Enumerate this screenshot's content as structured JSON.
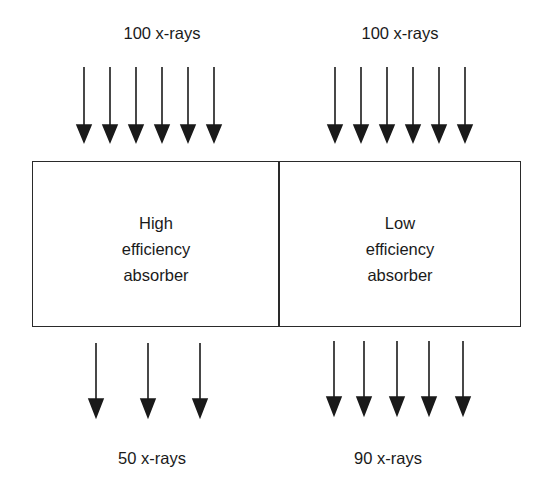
{
  "diagram": {
    "type": "absorber-efficiency-comparison",
    "colors": {
      "line": "#1a1a1a",
      "background": "#ffffff"
    },
    "left": {
      "incident_label": "100 x-rays",
      "incident_arrow_count": 6,
      "absorber_label_lines": [
        "High",
        "efficiency",
        "absorber"
      ],
      "transmitted_label": "50 x-rays",
      "transmitted_arrow_count": 3
    },
    "right": {
      "incident_label": "100 x-rays",
      "incident_arrow_count": 6,
      "absorber_label_lines": [
        "Low",
        "efficiency",
        "absorber"
      ],
      "transmitted_label": "90 x-rays",
      "transmitted_arrow_count": 5
    }
  }
}
